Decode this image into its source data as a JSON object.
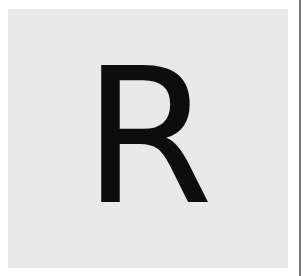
{
  "tile": {
    "letter": "R",
    "background_color": "#e9e9e9",
    "letter_color": "#0d0d0d"
  },
  "divider": {
    "color": "#7a7a7a"
  }
}
